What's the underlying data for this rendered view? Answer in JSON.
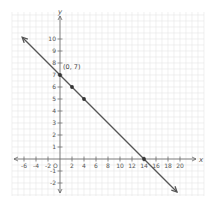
{
  "chart_data": {
    "type": "line",
    "title": "",
    "xlabel": "x",
    "ylabel": "y",
    "xlim": [
      -7,
      21
    ],
    "ylim": [
      -2.5,
      11
    ],
    "grid": true,
    "x_ticks": [
      -6,
      -4,
      -2,
      2,
      4,
      6,
      8,
      10,
      12,
      14,
      16,
      18,
      20
    ],
    "y_ticks": [
      -2,
      -1,
      1,
      2,
      3,
      4,
      5,
      6,
      7,
      8,
      9,
      10
    ],
    "origin_label": "O",
    "series": [
      {
        "name": "line",
        "equation": "y = -x/2 + 7",
        "slope": -0.5,
        "intercept": 7,
        "x": [
          -6.3,
          19.5
        ],
        "y": [
          10.15,
          -2.75
        ],
        "arrows": "both"
      }
    ],
    "points": [
      {
        "x": 0,
        "y": 7,
        "label": "(0, 7)"
      },
      {
        "x": 2,
        "y": 6,
        "label": ""
      },
      {
        "x": 4,
        "y": 5,
        "label": ""
      },
      {
        "x": 14,
        "y": 0,
        "label": ""
      }
    ]
  },
  "colors": {
    "grid": "#e6e6e6",
    "axis": "#666666",
    "line": "#555555",
    "point": "#333333"
  }
}
